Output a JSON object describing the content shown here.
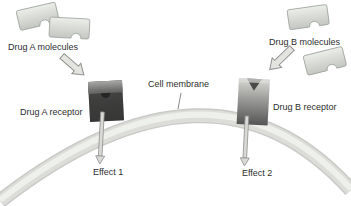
{
  "diagram": {
    "type": "biology-pharmacology-diagram",
    "labels": {
      "drug_a_molecules": "Drug A molecules",
      "drug_b_molecules": "Drug B molecules",
      "drug_a_receptor": "Drug A receptor",
      "drug_b_receptor": "Drug B receptor",
      "cell_membrane": "Cell membrane",
      "effect_1": "Effect 1",
      "effect_2": "Effect 2"
    },
    "colors": {
      "background": "#ffffff",
      "membrane_band": "#d2d3cf",
      "membrane_highlight": "#eaebe7",
      "molecule_fill_light": "#eceeea",
      "molecule_fill_dark": "#c4c6c1",
      "molecule_outline": "#9aa09a",
      "receptor_a_top": "#9a9a9a",
      "receptor_a_body": "#2c2c2c",
      "receptor_b_top": "#d4d4d0",
      "receptor_b_body": "#555555",
      "big_arrow_fill": "#e3e4e0",
      "big_arrow_outline": "#8f938f",
      "effect_arrow_fill": "#d9dad6",
      "effect_arrow_outline": "#8f8f8f",
      "label_text": "#2e2e2e"
    }
  }
}
